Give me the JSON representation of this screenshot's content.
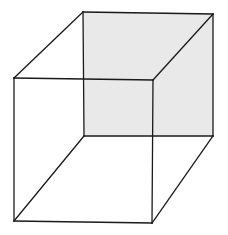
{
  "figure": {
    "width": 228,
    "height": 235,
    "background": "#ffffff",
    "stroke_color": "#1a1a1a",
    "stroke_width": 1.3,
    "shaded_face_fill": "#e9e9e9",
    "vertices": {
      "back_top_left": [
        83,
        12
      ],
      "back_top_right": [
        213,
        14
      ],
      "back_bottom_left": [
        84,
        136
      ],
      "back_bottom_right": [
        213,
        136
      ],
      "front_top_left": [
        14,
        78
      ],
      "front_top_right": [
        153,
        80
      ],
      "front_bottom_left": [
        14,
        221
      ],
      "front_bottom_right": [
        152,
        223
      ]
    },
    "shaded_face": "back"
  }
}
